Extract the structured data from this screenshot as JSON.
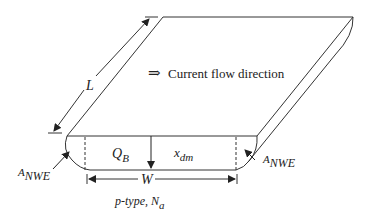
{
  "diagram": {
    "labels": {
      "length": "L",
      "flow_arrow_glyph": "⇒",
      "flow_text": "Current flow direction",
      "charge": "Q",
      "charge_sub": "B",
      "depletion": "x",
      "depletion_sub": "dm",
      "width": "W",
      "edge_left": "A",
      "edge_left_sub": "NWE",
      "edge_right": "A",
      "edge_right_sub": "NWE",
      "substrate": "p-type, N",
      "substrate_sub": "a"
    },
    "colors": {
      "stroke": "#333333",
      "text": "#222222",
      "background": "#ffffff"
    }
  }
}
